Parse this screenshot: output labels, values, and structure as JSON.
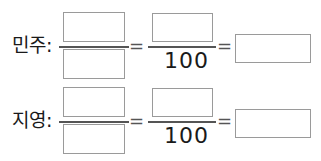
{
  "rows": [
    {
      "label": "민주:",
      "fraction1": {
        "numerator": "",
        "denominator": ""
      },
      "equals1": "=",
      "fraction2": {
        "numerator": "",
        "denominator": "100"
      },
      "equals2": "=",
      "answer": ""
    },
    {
      "label": "지영:",
      "fraction1": {
        "numerator": "",
        "denominator": ""
      },
      "equals1": "=",
      "fraction2": {
        "numerator": "",
        "denominator": "100"
      },
      "equals2": "=",
      "answer": ""
    }
  ]
}
